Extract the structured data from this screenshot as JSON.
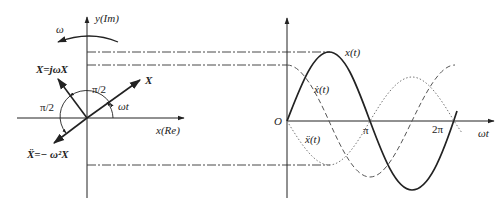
{
  "phasor": {
    "y_axis_label": "y(Im)",
    "x_axis_label": "x(Re)",
    "rotation_label": "ω",
    "vector_x_label": "X",
    "vector_velocity_label": "X=jωX",
    "vector_accel_label": "Ẍ=− ω²X",
    "angle_upper_label": "π/2",
    "angle_left_label": "π/2",
    "angle_wt_label": "ωt"
  },
  "waveform": {
    "origin_label": "O",
    "x_axis_label": "ωt",
    "tick_pi_label": "π",
    "tick_2pi_label": "2π",
    "curve_displacement_label": "x(t)",
    "curve_velocity_label": "ẋ(t)",
    "curve_accel_label": "ẍ(t)"
  },
  "colors": {
    "stroke": "#222222",
    "curve_dashed": "#555555",
    "curve_dotted": "#777777"
  }
}
